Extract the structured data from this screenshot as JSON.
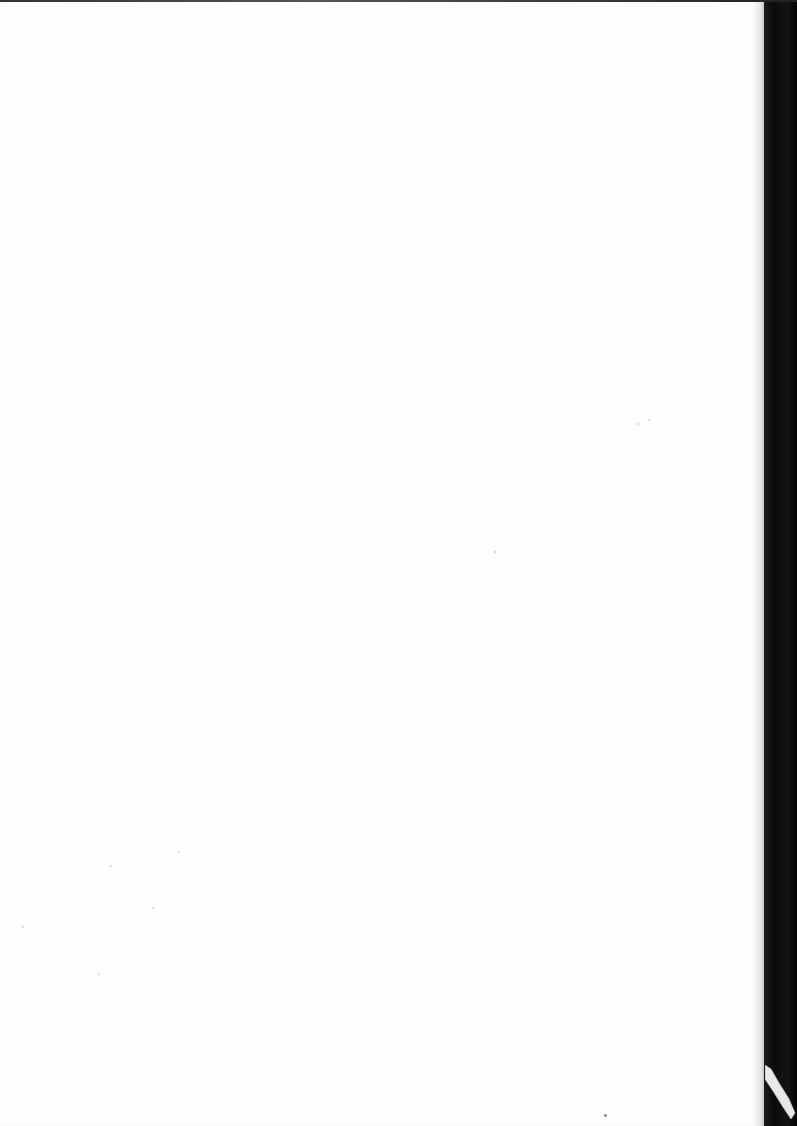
{
  "document": {
    "type": "scanned-page",
    "content": "",
    "state": "blank"
  },
  "colors": {
    "paper": "#fdfdfd",
    "scan_background": "#0b0b0b"
  }
}
